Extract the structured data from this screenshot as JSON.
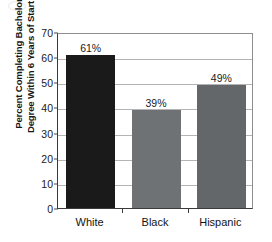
{
  "chart_data": {
    "type": "bar",
    "title": "",
    "subtitle": "",
    "xlabel": "",
    "ylabel": "Percent Completing Bachelor's Degree Within 6 Years of Starting",
    "ylabel_lines": [
      "Percent Completing Bachelor's",
      "Degree Within 6 Years of Starting"
    ],
    "categories": [
      "White",
      "Black",
      "Hispanic"
    ],
    "values": [
      61,
      39,
      49
    ],
    "data_labels": [
      "61%",
      "39%",
      "49%"
    ],
    "ylim": [
      0,
      70
    ],
    "ytick_values": [
      0,
      10,
      20,
      30,
      40,
      50,
      60,
      70
    ],
    "ytick_labels": [
      "0",
      "10",
      "20",
      "30",
      "40",
      "50",
      "60",
      "70"
    ],
    "grid": true,
    "grid_axis": "y",
    "legend": false,
    "legend_position": "none",
    "bar_colors": [
      "#1a1a1a",
      "#6e7275",
      "#636769"
    ],
    "colors": {
      "gridline": "#b4b4b4",
      "frame": "#8e8e8e",
      "axis": "#3a3a3a",
      "text": "#1a1a1a",
      "background": "#ffffff"
    }
  }
}
